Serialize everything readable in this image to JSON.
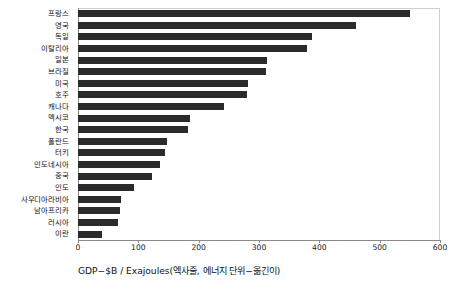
{
  "chart_data": {
    "type": "bar",
    "orientation": "horizontal",
    "title": "",
    "xlabel": "GDP−$B / Exajoules(엑사줄, 에너지 단위−옮긴이)",
    "ylabel": "",
    "xlim": [
      0,
      600
    ],
    "xticks": [
      0,
      100,
      200,
      300,
      400,
      500,
      600
    ],
    "xtick_labels": [
      "0",
      "100",
      "200",
      "300",
      "400",
      "500",
      "600"
    ],
    "grid": false,
    "legend": "none",
    "bar_color": "#2b2b2b",
    "categories": [
      "프랑스",
      "영국",
      "독일",
      "이탈리아",
      "일본",
      "브라질",
      "미국",
      "호주",
      "캐나다",
      "멕시코",
      "한국",
      "폴란드",
      "터키",
      "인도네시아",
      "중국",
      "인도",
      "사우디아라비아",
      "남아프리카",
      "러시아",
      "이란"
    ],
    "values": [
      550,
      460,
      388,
      380,
      313,
      312,
      282,
      280,
      242,
      186,
      183,
      148,
      144,
      136,
      122,
      93,
      71,
      70,
      66,
      40
    ]
  }
}
